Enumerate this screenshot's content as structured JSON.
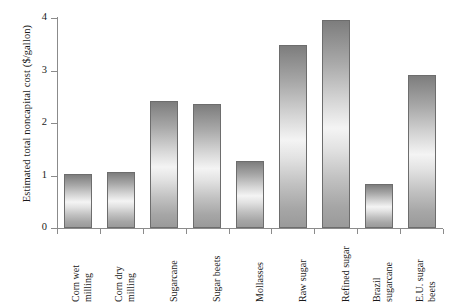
{
  "chart_data": {
    "type": "bar",
    "title": "",
    "xlabel": "",
    "ylabel": "Estimated total noncapital cost ($/gallon)",
    "ylim": [
      0,
      4
    ],
    "yticks": [
      "0",
      "1",
      "2",
      "3",
      "4"
    ],
    "grid": false,
    "legend": "none",
    "categories": [
      "Corn wet milling",
      "Corn dry milling",
      "Sugarcane",
      "Sugar beets",
      "Mollasses",
      "Raw sugar",
      "Refined sugar",
      "Brazil sugarcane",
      "E.U. sugar beets"
    ],
    "category_lines": [
      [
        "Corn wet",
        "milling"
      ],
      [
        "Corn dry",
        "milling"
      ],
      [
        "Sugarcane"
      ],
      [
        "Sugar beets"
      ],
      [
        "Mollasses"
      ],
      [
        "Raw sugar"
      ],
      [
        "Refined sugar"
      ],
      [
        "Brazil",
        "sugarcane"
      ],
      [
        "E.U. sugar",
        "beets"
      ]
    ],
    "values": [
      1.03,
      1.06,
      2.41,
      2.36,
      1.27,
      3.48,
      3.97,
      0.83,
      2.92
    ],
    "bar_color": "#b4b4b4",
    "bar_edge_color": "#6d6d6d",
    "axis_color": "#8b8b8b"
  }
}
